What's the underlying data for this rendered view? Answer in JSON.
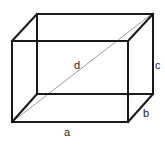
{
  "diagram": {
    "type": "rectangular-cuboid",
    "labels": {
      "a": "a",
      "b": "b",
      "c": "c",
      "d": "d"
    },
    "colors": {
      "edge": "#1a1a1a",
      "diagonal": "#9a9a9a",
      "background": "#ffffff"
    }
  }
}
